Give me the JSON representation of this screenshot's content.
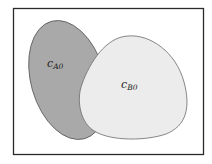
{
  "diagram": {
    "type": "set-overlap",
    "frame": {
      "stroke": "#2a2a2a",
      "fill": "#ffffff"
    },
    "regions": [
      {
        "id": "A",
        "label_main": "c",
        "label_sub": "A0",
        "fill": "#a9a9a9",
        "stroke": "#5a5a5a"
      },
      {
        "id": "B",
        "label_main": "c",
        "label_sub": "B0",
        "fill": "#ececec",
        "stroke": "#6a6a6a"
      }
    ]
  }
}
